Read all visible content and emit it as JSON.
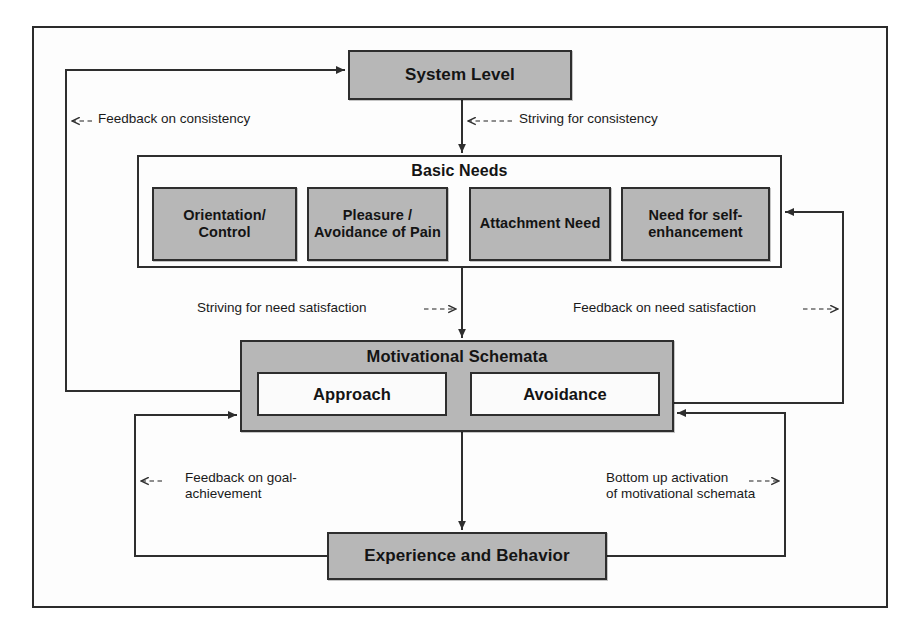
{
  "diagram": {
    "colors": {
      "box_fill_gray": "#b7b7b7",
      "box_fill_white": "#fbfbfb",
      "line": "#2e2e2e",
      "text": "#141414",
      "frame": "#2b2b2b",
      "page_background": "#ffffff"
    },
    "nodes": {
      "system_level": {
        "label": "System Level"
      },
      "basic_needs": {
        "title": "Basic Needs",
        "items": [
          {
            "label": "Orientation/\nControl"
          },
          {
            "label": "Pleasure /\nAvoidance\nof Pain"
          },
          {
            "label": "Attachment\nNeed"
          },
          {
            "label": "Need for self-\nenhancement"
          }
        ]
      },
      "motivational_schemata": {
        "title": "Motivational Schemata",
        "items": [
          {
            "label": "Approach"
          },
          {
            "label": "Avoidance"
          }
        ]
      },
      "experience_behavior": {
        "label": "Experience and Behavior"
      }
    },
    "edge_labels": {
      "feedback_on_consistency": "Feedback on consistency",
      "striving_for_consistency": "Striving for consistency",
      "striving_for_need_satisfaction": "Striving for need satisfaction",
      "feedback_on_need_satisfaction": "Feedback on need satisfaction",
      "feedback_on_goal_achievement": "Feedback on goal-\nachievement",
      "bottom_up_activation": "Bottom up activation\nof motivational schemata"
    }
  }
}
